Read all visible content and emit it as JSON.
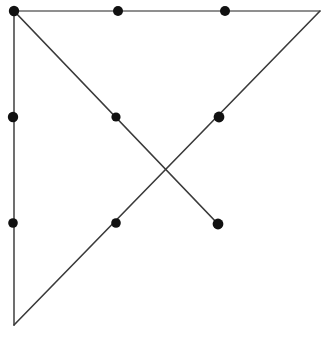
{
  "figure": {
    "canvas": {
      "width": 325,
      "height": 337,
      "background": "#ffffff"
    },
    "style": {
      "line_color": "#3a3a3a",
      "line_color_light": "#6b6b6b",
      "dot_color": "#111111",
      "line_width": 1.6,
      "dot_radius": 5.0
    },
    "segments": [
      {
        "name": "top-edge",
        "x1": 14,
        "y1": 11,
        "x2": 320,
        "y2": 11,
        "color": "#6b6b6b",
        "width": 1.5
      },
      {
        "name": "left-edge",
        "x1": 14,
        "y1": 11,
        "x2": 14,
        "y2": 325,
        "color": "#555555",
        "width": 1.7
      },
      {
        "name": "hypotenuse",
        "x1": 14,
        "y1": 325,
        "x2": 320,
        "y2": 11,
        "color": "#3a3a3a",
        "width": 1.6
      },
      {
        "name": "descending-diagonal",
        "x1": 14,
        "y1": 11,
        "x2": 218,
        "y2": 224,
        "color": "#3a3a3a",
        "width": 1.7
      }
    ],
    "points": [
      {
        "name": "corner-top-left",
        "x": 14,
        "y": 11,
        "r": 5.2
      },
      {
        "name": "top-edge-point-1",
        "x": 118,
        "y": 11,
        "r": 5.0
      },
      {
        "name": "top-edge-point-2",
        "x": 225,
        "y": 11,
        "r": 5.0
      },
      {
        "name": "left-edge-point-1",
        "x": 13,
        "y": 117,
        "r": 5.2
      },
      {
        "name": "left-edge-point-2",
        "x": 13,
        "y": 223,
        "r": 4.8
      },
      {
        "name": "descending-diagonal-point-1",
        "x": 116,
        "y": 117,
        "r": 4.6
      },
      {
        "name": "descending-diagonal-endpoint",
        "x": 218,
        "y": 224,
        "r": 5.4
      },
      {
        "name": "hypotenuse-point-upper",
        "x": 219,
        "y": 117,
        "r": 5.4
      },
      {
        "name": "hypotenuse-point-lower",
        "x": 116,
        "y": 223,
        "r": 4.8
      }
    ]
  },
  "chart_data": {
    "type": "scatter",
    "xlabel": "",
    "ylabel": "",
    "xlim": [
      0,
      325
    ],
    "ylim": [
      0,
      337
    ],
    "grid": false,
    "legend": "none",
    "x": [
      14,
      118,
      225,
      13,
      13,
      116,
      218,
      219,
      116
    ],
    "y": [
      11,
      11,
      11,
      117,
      223,
      117,
      224,
      117,
      223
    ],
    "point_labels": [
      "corner-top-left",
      "top-edge-point-1",
      "top-edge-point-2",
      "left-edge-point-1",
      "left-edge-point-2",
      "descending-diagonal-point-1",
      "descending-diagonal-endpoint",
      "hypotenuse-point-upper",
      "hypotenuse-point-lower"
    ],
    "lines": [
      {
        "name": "top-edge",
        "x": [
          14,
          320
        ],
        "y": [
          11,
          11
        ]
      },
      {
        "name": "left-edge",
        "x": [
          14,
          14
        ],
        "y": [
          11,
          325
        ]
      },
      {
        "name": "hypotenuse",
        "x": [
          14,
          320
        ],
        "y": [
          325,
          11
        ]
      },
      {
        "name": "descending-diagonal",
        "x": [
          14,
          218
        ],
        "y": [
          11,
          224
        ]
      }
    ],
    "annotations": [
      {
        "name": "intersection",
        "x": 167,
        "y": 171
      },
      {
        "name": "corner-top-right",
        "x": 320,
        "y": 11
      },
      {
        "name": "corner-bottom-left",
        "x": 14,
        "y": 325
      }
    ]
  }
}
